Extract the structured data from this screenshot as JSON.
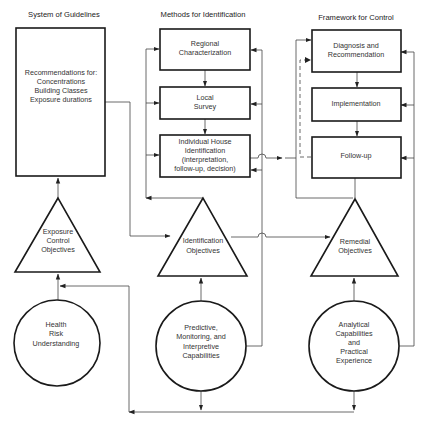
{
  "columns": [
    {
      "id": "guidelines",
      "title": "System of Guidelines"
    },
    {
      "id": "identification",
      "title": "Methods for Identification"
    },
    {
      "id": "control",
      "title": "Framework for Control"
    }
  ],
  "guidelines": {
    "box": {
      "lines": [
        "Recommendations for:",
        "Concentrations",
        "Building Classes",
        "Exposure durations"
      ]
    },
    "triangle": {
      "lines": [
        "Exposure",
        "Control",
        "Objectives"
      ]
    },
    "circle": {
      "lines": [
        "Health",
        "Risk",
        "Understanding"
      ]
    }
  },
  "identification": {
    "boxes": [
      {
        "lines": [
          "Regional",
          "Characterization"
        ]
      },
      {
        "lines": [
          "Local",
          "Survey"
        ]
      },
      {
        "lines": [
          "Individual House",
          "Identification",
          "(interpretation,",
          "follow-up, decision)"
        ]
      }
    ],
    "triangle": {
      "lines": [
        "Identification",
        "Objectives"
      ]
    },
    "circle": {
      "lines": [
        "Predictive,",
        "Monitoring, and",
        "Interpretive",
        "Capabilities"
      ]
    }
  },
  "control": {
    "boxes": [
      {
        "lines": [
          "Diagnosis and",
          "Recommendation"
        ]
      },
      {
        "lines": [
          "Implementation"
        ]
      },
      {
        "lines": [
          "Follow-up"
        ]
      }
    ],
    "triangle": {
      "lines": [
        "Remedial",
        "Objectives"
      ]
    },
    "circle": {
      "lines": [
        "Analytical",
        "Capabilities",
        "and",
        "Practical",
        "Experience"
      ]
    }
  },
  "colors": {
    "stroke": "#1a1a1a",
    "connector": "#444444",
    "text": "#333333",
    "background": "#ffffff"
  }
}
